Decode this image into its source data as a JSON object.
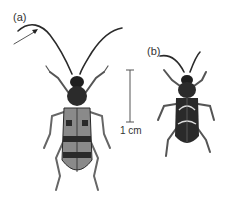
{
  "figure": {
    "panels": [
      {
        "label": "(a)",
        "subject": "longhorn beetle, larger specimen, dorsal view, with arrow pointing to antenna"
      },
      {
        "label": "(b)",
        "subject": "longhorn beetle, smaller specimen, dorsal view"
      }
    ],
    "scale_bar": {
      "label": "1 cm"
    },
    "colors": {
      "ink": "#2a2a2a",
      "shade": "#6a6a6a",
      "light": "#bdbdbd",
      "background": "#ffffff"
    }
  }
}
